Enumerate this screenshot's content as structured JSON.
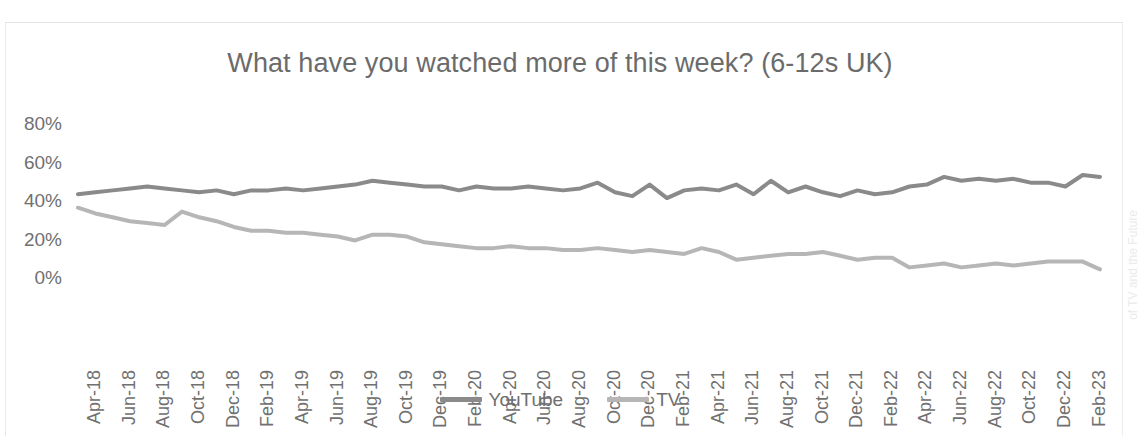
{
  "chart_data": {
    "type": "line",
    "title": "What have you watched more of this week? (6-12s UK)",
    "xlabel": "",
    "ylabel": "",
    "ylim": [
      0,
      80
    ],
    "ytick_labels": [
      "80%",
      "60%",
      "40%",
      "20%",
      "0%"
    ],
    "ytick_values": [
      80,
      60,
      40,
      20,
      0
    ],
    "grid": false,
    "legend_position": "bottom-center",
    "x": [
      "Apr-18",
      "May-18",
      "Jun-18",
      "Jul-18",
      "Aug-18",
      "Sep-18",
      "Oct-18",
      "Nov-18",
      "Dec-18",
      "Jan-19",
      "Feb-19",
      "Mar-19",
      "Apr-19",
      "May-19",
      "Jun-19",
      "Jul-19",
      "Aug-19",
      "Sep-19",
      "Oct-19",
      "Nov-19",
      "Dec-19",
      "Jan-20",
      "Feb-20",
      "Mar-20",
      "Apr-20",
      "May-20",
      "Jun-20",
      "Jul-20",
      "Aug-20",
      "Sep-20",
      "Oct-20",
      "Nov-20",
      "Dec-20",
      "Jan-21",
      "Feb-21",
      "Mar-21",
      "Apr-21",
      "May-21",
      "Jun-21",
      "Jul-21",
      "Aug-21",
      "Sep-21",
      "Oct-21",
      "Nov-21",
      "Dec-21",
      "Jan-22",
      "Feb-22",
      "Mar-22",
      "Apr-22",
      "May-22",
      "Jun-22",
      "Jul-22",
      "Aug-22",
      "Sep-22",
      "Oct-22",
      "Nov-22",
      "Dec-22",
      "Jan-23",
      "Feb-23",
      "Mar-23"
    ],
    "xtick_labels": [
      "Apr-18",
      "Jun-18",
      "Aug-18",
      "Oct-18",
      "Dec-18",
      "Feb-19",
      "Apr-19",
      "Jun-19",
      "Aug-19",
      "Oct-19",
      "Dec-19",
      "Feb-20",
      "Apr-20",
      "Jun-20",
      "Aug-20",
      "Oct-20",
      "Dec-20",
      "Feb-21",
      "Apr-21",
      "Jun-21",
      "Aug-21",
      "Oct-21",
      "Dec-21",
      "Feb-22",
      "Apr-22",
      "Jun-22",
      "Aug-22",
      "Oct-22",
      "Dec-22",
      "Feb-23"
    ],
    "xtick_step_months": 2,
    "series": [
      {
        "name": "YouTube",
        "color": "#8a8a8a",
        "values": [
          43,
          44,
          45,
          46,
          47,
          46,
          45,
          44,
          45,
          43,
          45,
          45,
          46,
          45,
          46,
          47,
          48,
          50,
          49,
          48,
          47,
          47,
          45,
          47,
          46,
          46,
          47,
          46,
          45,
          46,
          49,
          44,
          42,
          48,
          41,
          45,
          46,
          45,
          48,
          43,
          50,
          44,
          47,
          44,
          42,
          45,
          43,
          44,
          47,
          48,
          52,
          50,
          51,
          50,
          51,
          49,
          49,
          47,
          53,
          52
        ]
      },
      {
        "name": "TV",
        "color": "#b6b6b6",
        "values": [
          36,
          33,
          31,
          29,
          28,
          27,
          34,
          31,
          29,
          26,
          24,
          24,
          23,
          23,
          22,
          21,
          19,
          22,
          22,
          21,
          18,
          17,
          16,
          15,
          15,
          16,
          15,
          15,
          14,
          14,
          15,
          14,
          13,
          14,
          13,
          12,
          15,
          13,
          9,
          10,
          11,
          12,
          12,
          13,
          11,
          9,
          10,
          10,
          5,
          6,
          7,
          5,
          6,
          7,
          6,
          7,
          8,
          8,
          8,
          4
        ]
      }
    ]
  },
  "legend": {
    "items": [
      {
        "label": "YouTube",
        "color": "#8a8a8a"
      },
      {
        "label": "TV",
        "color": "#b6b6b6"
      }
    ]
  },
  "margin": {
    "cut_off_text": "of TV and the Future"
  }
}
